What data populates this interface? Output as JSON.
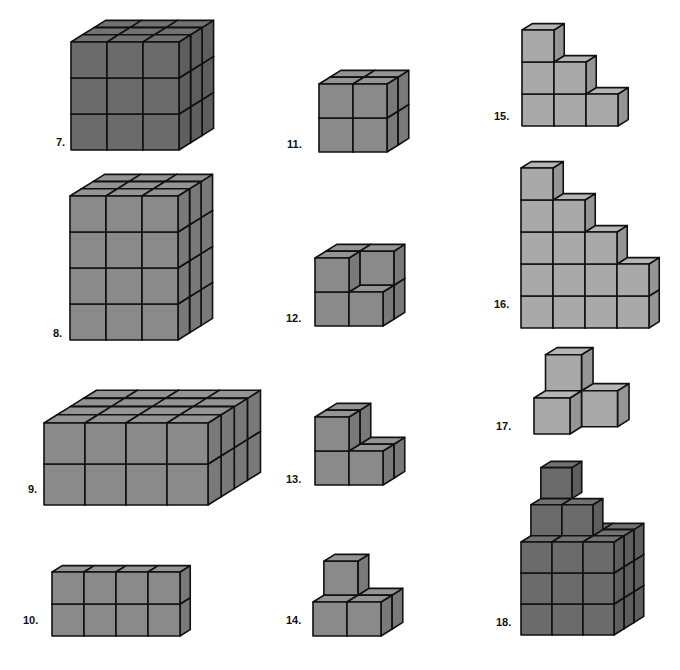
{
  "figures": [
    {
      "id": "7",
      "label": "7.",
      "shape": "3x3x3 cube",
      "dims": [
        3,
        3,
        3
      ]
    },
    {
      "id": "8",
      "label": "8.",
      "shape": "3 wide x 4 tall x 3 deep prism",
      "dims": [
        3,
        4,
        3
      ]
    },
    {
      "id": "9",
      "label": "9.",
      "shape": "4 wide x 2 tall x 4 deep prism",
      "dims": [
        4,
        2,
        4
      ]
    },
    {
      "id": "10",
      "label": "10.",
      "shape": "4 wide x 2 tall x 1 deep prism",
      "dims": [
        4,
        2,
        1
      ]
    },
    {
      "id": "11",
      "label": "11.",
      "shape": "2x2x2 cube",
      "dims": [
        2,
        2,
        2
      ]
    },
    {
      "id": "12",
      "label": "12.",
      "shape": "2x2x2 cube missing front-top-right block"
    },
    {
      "id": "13",
      "label": "13.",
      "shape": "L-shaped 4 blocks"
    },
    {
      "id": "14",
      "label": "14.",
      "shape": "4 blocks, 1 on top"
    },
    {
      "id": "15",
      "label": "15.",
      "shape": "staircase 3-2-1"
    },
    {
      "id": "16",
      "label": "16.",
      "shape": "staircase 5-4-3-2"
    },
    {
      "id": "17",
      "label": "17.",
      "shape": "3-block corner"
    },
    {
      "id": "18",
      "label": "18.",
      "shape": "3x3x3 cube with 3 blocks stacked on top"
    }
  ],
  "colors": {
    "dark": "#6b6b6b",
    "mid": "#8a8a8a",
    "light": "#a9a9a9",
    "line": "#111111"
  }
}
